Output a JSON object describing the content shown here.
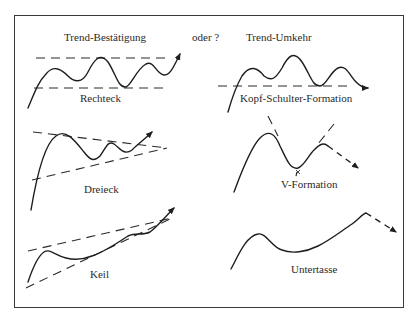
{
  "header": {
    "left_title": "Trend-Bestätigung",
    "connector": "oder ?",
    "right_title": "Trend-Umkehr"
  },
  "patterns": {
    "continuation": [
      {
        "label": "Rechteck"
      },
      {
        "label": "Dreieck"
      },
      {
        "label": "Keil"
      }
    ],
    "reversal": [
      {
        "label": "Kopf-Schulter-Formation"
      },
      {
        "label": "V-Formation"
      },
      {
        "label": "Untertasse"
      }
    ]
  },
  "colors": {
    "line": "#1e1e1e",
    "frame": "#3a3a3a",
    "background": "#ffffff"
  }
}
